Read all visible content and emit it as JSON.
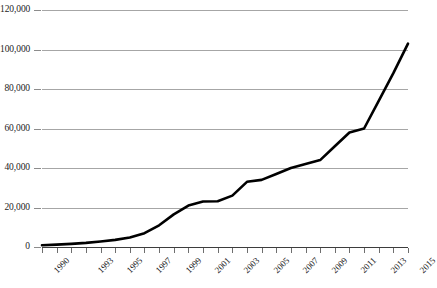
{
  "chart_data": {
    "type": "line",
    "title": "",
    "subtitle": "",
    "xlabel": "",
    "ylabel": "",
    "grid": "horizontal",
    "legend": "none",
    "xlim": [
      1990,
      2015
    ],
    "ylim": [
      0,
      120000
    ],
    "ytick_interval": 20000,
    "ytick_labels": [
      "0",
      "20,000",
      "40,000",
      "60,000",
      "80,000",
      "100,000",
      "120,000"
    ],
    "ytick_values": [
      0,
      20000,
      40000,
      60000,
      80000,
      100000,
      120000
    ],
    "xtick_values": [
      1990,
      1991,
      1992,
      1993,
      1994,
      1995,
      1996,
      1997,
      1998,
      1999,
      2000,
      2001,
      2002,
      2003,
      2004,
      2005,
      2006,
      2007,
      2008,
      2009,
      2010,
      2011,
      2012,
      2013,
      2014,
      2015
    ],
    "xtick_labels_shown": [
      "1990",
      "1993",
      "1995",
      "1997",
      "1999",
      "2001",
      "2003",
      "2005",
      "2007",
      "2009",
      "2011",
      "2013",
      "2015"
    ],
    "series": [
      {
        "name": "series-1",
        "color": "#000000",
        "line_width": 2.6,
        "markers": "none",
        "x": [
          1990,
          1991,
          1992,
          1993,
          1994,
          1995,
          1996,
          1997,
          1998,
          1999,
          2000,
          2001,
          2002,
          2003,
          2004,
          2005,
          2006,
          2007,
          2008,
          2009,
          2010,
          2011,
          2012,
          2013,
          2014,
          2015
        ],
        "values": [
          900,
          1200,
          1600,
          2100,
          2800,
          3600,
          4800,
          7000,
          11000,
          16500,
          21000,
          23000,
          23200,
          26000,
          33000,
          34000,
          37000,
          40000,
          42000,
          44000,
          51000,
          58000,
          60000,
          74000,
          88000,
          103000
        ]
      }
    ]
  },
  "caption": {
    "text": ""
  }
}
